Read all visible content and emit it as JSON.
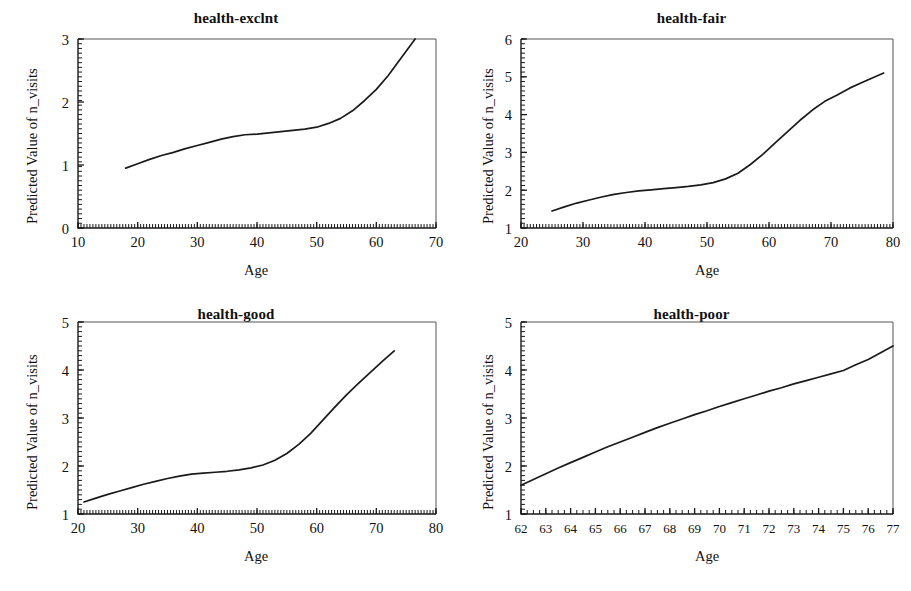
{
  "figure": {
    "kind": "multi-panel-line-plot",
    "panel_count": 4,
    "shared_ylabel": "Predicted Value of n_visits",
    "shared_xlabel": "Age",
    "line_color": "#1a1a1a",
    "background_color": "#ffffff"
  },
  "chart_data": [
    {
      "type": "line",
      "title": "health-exclnt",
      "xlabel": "Age",
      "ylabel": "Predicted Value of n_visits",
      "xlim": [
        10,
        70
      ],
      "ylim": [
        0,
        3
      ],
      "xticks": [
        10,
        20,
        30,
        40,
        50,
        60,
        70
      ],
      "yticks": [
        0,
        1,
        2,
        3
      ],
      "xtick_labels": [
        "10",
        "20",
        "30",
        "40",
        "50",
        "60",
        "70"
      ],
      "ytick_labels": [
        "0",
        "1",
        "2",
        "3"
      ],
      "grid": false,
      "legend": false,
      "minor_ticks": true,
      "series": [
        {
          "name": "predicted n_visits",
          "x": [
            18.0,
            20.0,
            22.0,
            24.0,
            26.0,
            28.0,
            30.0,
            32.0,
            34.0,
            36.0,
            38.0,
            40.0,
            42.0,
            44.0,
            46.0,
            48.0,
            50.0,
            52.0,
            54.0,
            56.0,
            58.0,
            60.0,
            62.0,
            64.0,
            66.5
          ],
          "y": [
            0.95,
            1.02,
            1.09,
            1.15,
            1.2,
            1.26,
            1.31,
            1.36,
            1.41,
            1.45,
            1.48,
            1.49,
            1.51,
            1.53,
            1.55,
            1.57,
            1.6,
            1.66,
            1.74,
            1.86,
            2.02,
            2.2,
            2.42,
            2.68,
            3.0
          ]
        }
      ]
    },
    {
      "type": "line",
      "title": "health-fair",
      "xlabel": "Age",
      "ylabel": "Predicted Value of n_visits",
      "xlim": [
        20,
        80
      ],
      "ylim": [
        1,
        6
      ],
      "xticks": [
        20,
        30,
        40,
        50,
        60,
        70,
        80
      ],
      "yticks": [
        1,
        2,
        3,
        4,
        5,
        6
      ],
      "xtick_labels": [
        "20",
        "30",
        "40",
        "50",
        "60",
        "70",
        "80"
      ],
      "ytick_labels": [
        "1",
        "2",
        "3",
        "4",
        "5",
        "6"
      ],
      "grid": false,
      "legend": false,
      "minor_ticks": true,
      "series": [
        {
          "name": "predicted n_visits",
          "x": [
            25.0,
            27.0,
            29.0,
            31.0,
            33.0,
            35.0,
            37.0,
            39.0,
            41.0,
            43.0,
            45.0,
            47.0,
            49.0,
            51.0,
            53.0,
            55.0,
            57.0,
            59.0,
            61.0,
            63.0,
            65.0,
            67.0,
            69.0,
            71.0,
            73.0,
            75.0,
            78.5
          ],
          "y": [
            1.45,
            1.56,
            1.66,
            1.74,
            1.82,
            1.89,
            1.94,
            1.98,
            2.01,
            2.04,
            2.07,
            2.1,
            2.14,
            2.2,
            2.3,
            2.45,
            2.68,
            2.95,
            3.25,
            3.55,
            3.85,
            4.12,
            4.35,
            4.52,
            4.7,
            4.85,
            5.1
          ]
        }
      ]
    },
    {
      "type": "line",
      "title": "health-good",
      "xlabel": "Age",
      "ylabel": "Predicted Value of n_visits",
      "xlim": [
        20,
        80
      ],
      "ylim": [
        1,
        5
      ],
      "xticks": [
        20,
        30,
        40,
        50,
        60,
        70,
        80
      ],
      "yticks": [
        1,
        2,
        3,
        4,
        5
      ],
      "xtick_labels": [
        "20",
        "30",
        "40",
        "50",
        "60",
        "70",
        "80"
      ],
      "ytick_labels": [
        "1",
        "2",
        "3",
        "4",
        "5"
      ],
      "grid": false,
      "legend": false,
      "minor_ticks": true,
      "series": [
        {
          "name": "predicted n_visits",
          "x": [
            21.0,
            23.0,
            25.0,
            27.0,
            29.0,
            31.0,
            33.0,
            35.0,
            37.0,
            39.0,
            41.0,
            43.0,
            45.0,
            47.0,
            49.0,
            51.0,
            53.0,
            55.0,
            57.0,
            59.0,
            61.0,
            63.0,
            65.0,
            67.0,
            69.0,
            71.0,
            73.0
          ],
          "y": [
            1.25,
            1.33,
            1.41,
            1.48,
            1.55,
            1.62,
            1.68,
            1.74,
            1.79,
            1.83,
            1.85,
            1.87,
            1.89,
            1.92,
            1.96,
            2.02,
            2.12,
            2.26,
            2.45,
            2.68,
            2.95,
            3.22,
            3.48,
            3.72,
            3.95,
            4.18,
            4.4
          ]
        }
      ]
    },
    {
      "type": "line",
      "title": "health-poor",
      "xlabel": "Age",
      "ylabel": "Predicted Value of n_visits",
      "xlim": [
        62,
        77
      ],
      "ylim": [
        1,
        5
      ],
      "xticks": [
        62,
        63,
        64,
        65,
        66,
        67,
        68,
        69,
        70,
        71,
        72,
        73,
        74,
        75,
        76,
        77
      ],
      "yticks": [
        1,
        2,
        3,
        4,
        5
      ],
      "xtick_labels": [
        "62",
        "63",
        "64",
        "65",
        "66",
        "67",
        "68",
        "69",
        "70",
        "71",
        "72",
        "73",
        "74",
        "75",
        "76",
        "77"
      ],
      "ytick_labels": [
        "1",
        "2",
        "3",
        "4",
        "5"
      ],
      "grid": false,
      "legend": false,
      "minor_ticks": true,
      "series": [
        {
          "name": "predicted n_visits",
          "x": [
            62.0,
            62.5,
            63.0,
            63.5,
            64.0,
            64.5,
            65.0,
            65.5,
            66.0,
            66.5,
            67.0,
            67.5,
            68.0,
            68.5,
            69.0,
            69.5,
            70.0,
            70.5,
            71.0,
            71.5,
            72.0,
            72.5,
            73.0,
            73.5,
            74.0,
            74.5,
            75.0,
            75.5,
            76.0,
            76.5,
            77.0
          ],
          "y": [
            1.6,
            1.72,
            1.84,
            1.96,
            2.07,
            2.18,
            2.29,
            2.4,
            2.5,
            2.6,
            2.7,
            2.8,
            2.89,
            2.98,
            3.07,
            3.15,
            3.24,
            3.32,
            3.4,
            3.48,
            3.56,
            3.63,
            3.71,
            3.78,
            3.85,
            3.92,
            3.99,
            4.11,
            4.22,
            4.36,
            4.5
          ]
        }
      ]
    }
  ]
}
